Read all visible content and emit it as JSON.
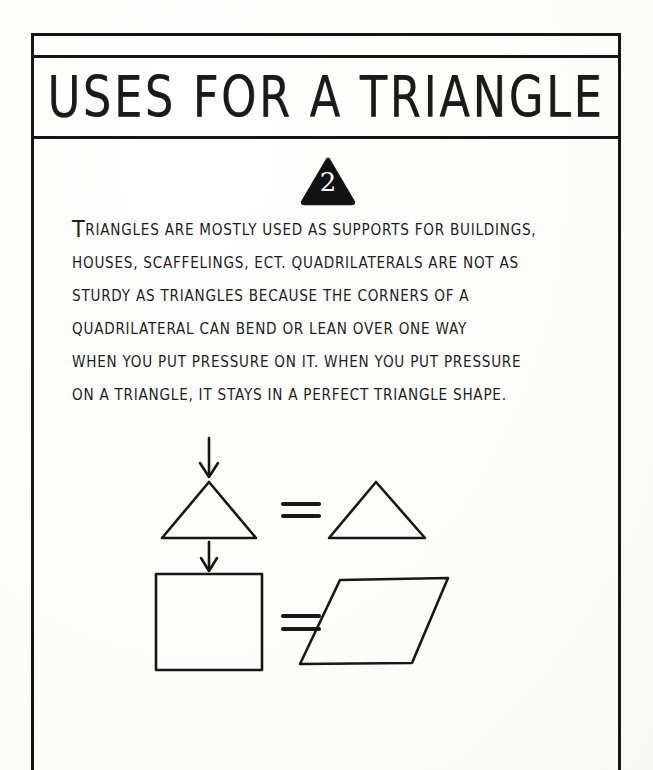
{
  "document": {
    "kind": "handwritten-worksheet-page",
    "title": "USES FOR A TRIANGLE",
    "page_number": "2",
    "ink_color": "#1a1a1a",
    "paper_color": "#ffffff"
  },
  "badge": {
    "shape": "triangle",
    "fill": "#111111",
    "number": "2"
  },
  "body": {
    "lead_letter": "T",
    "lines": [
      "RIANGLES ARE MOSTLY USED AS SUPPORTS FOR BUILDINGS,",
      "HOUSES, SCAFFELINGS, ECT. QUADRILATERALS ARE NOT AS",
      "STURDY AS TRIANGLES BECAUSE THE CORNERS OF A",
      "QUADRILATERAL CAN BEND OR LEAN OVER ONE WAY",
      "WHEN YOU PUT PRESSURE ON IT. WHEN YOU PUT PRESSURE",
      "ON A TRIANGLE, IT STAYS IN A PERFECT TRIANGLE SHAPE."
    ],
    "full_text": "TRIANGLES ARE MOSTLY USED AS SUPPORTS FOR BUILDINGS, HOUSES, SCAFFELINGS, ECT. QUADRILATERALS ARE NOT AS STURDY AS TRIANGLES BECAUSE THE CORNERS OF A QUADRILATERAL CAN BEND OR LEAN OVER ONE WAY WHEN YOU PUT PRESSURE ON IT. WHEN YOU PUT PRESSURE ON A TRIANGLE, IT STAYS IN A PERFECT TRIANGLE SHAPE."
  },
  "figure": {
    "caption": "pressure-on-shapes diagram",
    "rows": [
      {
        "name": "triangle-row",
        "left_shape": "triangle",
        "arrow": "down-arrow-above",
        "relation": "=",
        "right_shape": "triangle",
        "meaning": "a triangle under pressure stays a triangle"
      },
      {
        "name": "square-row",
        "left_shape": "square",
        "arrow": "down-arrow-above",
        "relation": "=",
        "right_shape": "parallelogram",
        "meaning": "a square under pressure leans into a parallelogram"
      }
    ],
    "relation_symbol": "="
  }
}
